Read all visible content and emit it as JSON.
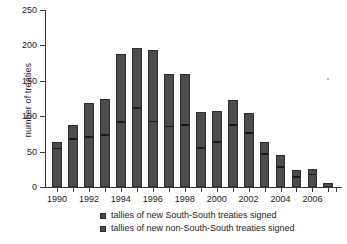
{
  "chart_data": {
    "type": "bar",
    "title": "",
    "subtitle": "",
    "xlabel": "",
    "ylabel": "number of treaties",
    "stacked": true,
    "grid": false,
    "legend_position": "bottom",
    "ylim": [
      0,
      250
    ],
    "yticks": [
      0,
      50,
      100,
      150,
      200,
      250
    ],
    "xticks_labeled": [
      "1990",
      "1992",
      "1994",
      "1996",
      "1998",
      "2000",
      "2002",
      "2004",
      "2006"
    ],
    "categories": [
      "1990",
      "1991",
      "1992",
      "1993",
      "1994",
      "1995",
      "1996",
      "1997",
      "1998",
      "1999",
      "2000",
      "2001",
      "2002",
      "2003",
      "2004",
      "2005",
      "2006",
      "2007"
    ],
    "series": [
      {
        "name": "tallies of new South-South treaties signed",
        "color": "#4c4c4c",
        "values": [
          57,
          70,
          73,
          76,
          94,
          114,
          95,
          88,
          90,
          58,
          66,
          90,
          79,
          49,
          31,
          17,
          20,
          6
        ]
      },
      {
        "name": "tallies of new non-South-South treaties signed",
        "color": "#4c4c4c",
        "values": [
          7,
          17,
          45,
          49,
          94,
          82,
          99,
          71,
          69,
          48,
          41,
          33,
          26,
          15,
          14,
          7,
          6,
          0
        ]
      }
    ],
    "totals": [
      64,
      87,
      118,
      125,
      188,
      196,
      194,
      159,
      159,
      106,
      107,
      123,
      105,
      64,
      45,
      24,
      26,
      6
    ]
  },
  "legend": {
    "items": [
      {
        "label": "tallies of new South-South treaties signed"
      },
      {
        "label": "tallies of new non-South-South treaties signed"
      }
    ]
  },
  "axis": {
    "y_title": "number of treaties",
    "y_tick_labels": [
      "250",
      "200",
      "150",
      "100",
      "50",
      "0"
    ],
    "x_tick_labels": [
      "1990",
      "1992",
      "1994",
      "1996",
      "1998",
      "2000",
      "2002",
      "2004",
      "2006"
    ]
  }
}
